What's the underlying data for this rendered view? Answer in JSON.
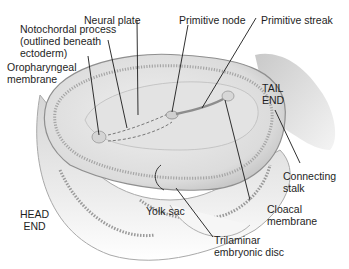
{
  "diagram": {
    "type": "anatomical-illustration",
    "labels": {
      "notochordal_process": [
        "Notochordal process",
        "(outlined beneath",
        "ectoderm)"
      ],
      "neural_plate": "Neural plate",
      "primitive_node": "Primitive node",
      "primitive_streak": "Primitive streak",
      "oropharyngeal_membrane": [
        "Oropharyngeal",
        "membrane"
      ],
      "tail_end": [
        "TAIL",
        "END"
      ],
      "connecting_stalk": [
        "Connecting",
        "stalk"
      ],
      "head_end": [
        "HEAD",
        "END"
      ],
      "yolk_sac": "Yolk sac",
      "cloacal_membrane": [
        "Cloacal",
        "membrane"
      ],
      "trilaminar_disc": [
        "Trilaminar",
        "embryonic disc"
      ]
    },
    "colors": {
      "background": "#ffffff",
      "tissue_light": "#e6e6e6",
      "tissue_mid": "#c8c8c8",
      "tissue_dark": "#8a8a8a",
      "leader_line": "#1a1a1a"
    }
  }
}
